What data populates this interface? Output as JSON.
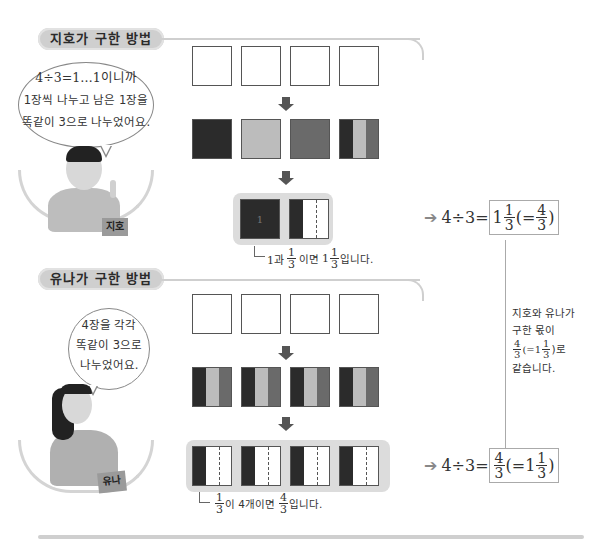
{
  "section1": {
    "title": "지호가 구한 방법",
    "bubble": [
      "4÷3=1…1이니까",
      "1장씩 나누고 남은 1장을",
      "똑같이 3으로 나누었어요."
    ],
    "name_tag": "지호",
    "row1": [
      "blank",
      "blank",
      "blank",
      "blank"
    ],
    "row2": [
      "dark",
      "light",
      "mid",
      "split-thirds"
    ],
    "row3": [
      "whole-dark",
      "third-dark"
    ],
    "tile_labels": {
      "whole": "1",
      "third_num": "1",
      "third_den": "3"
    },
    "caption": {
      "prefix": "1과",
      "frac1": {
        "n": "1",
        "d": "3"
      },
      "mid": "이면",
      "whole": "1",
      "frac2": {
        "n": "1",
        "d": "3"
      },
      "suffix": "입니다."
    },
    "result": {
      "expr": "4÷3=",
      "boxed_whole": "1",
      "boxed_frac": {
        "n": "1",
        "d": "3"
      },
      "paren_open": "(=",
      "alt_frac": {
        "n": "4",
        "d": "3"
      },
      "paren_close": ")"
    }
  },
  "section2": {
    "title": "유나가 구한 방법",
    "bubble": [
      "4장을 각각",
      "똑같이 3으로",
      "나누었어요."
    ],
    "name_tag": "유나",
    "row1": [
      "blank",
      "blank",
      "blank",
      "blank"
    ],
    "row2": [
      "split-thirds",
      "split-thirds",
      "split-thirds",
      "split-thirds"
    ],
    "row3": [
      "third-dark",
      "third-dark",
      "third-dark",
      "third-dark"
    ],
    "tile_labels": {
      "third_num": "1",
      "third_den": "3"
    },
    "caption": {
      "frac1": {
        "n": "1",
        "d": "3"
      },
      "mid": "이 4개이면",
      "frac2": {
        "n": "4",
        "d": "3"
      },
      "suffix": "입니다."
    },
    "result": {
      "expr": "4÷3=",
      "boxed_frac": {
        "n": "4",
        "d": "3"
      },
      "paren_open": "(=",
      "alt_whole": "1",
      "alt_frac": {
        "n": "1",
        "d": "3"
      },
      "paren_close": ")"
    }
  },
  "note": {
    "line1": "지호와 유나가",
    "line2": "구한 몫이",
    "frac": {
      "n": "4",
      "d": "3"
    },
    "paren_open": "(=1",
    "mixed_frac": {
      "n": "1",
      "d": "3"
    },
    "paren_close": ")로",
    "line4": "같습니다."
  },
  "colors": {
    "dark": "#2b2b2b",
    "light": "#bcbcbc",
    "mid": "#6a6a6a",
    "pill": "#cfcfcf"
  }
}
